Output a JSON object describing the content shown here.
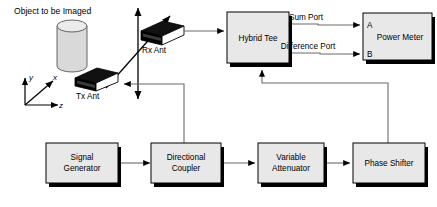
{
  "diagram": {
    "title_label": "Object to be Imaged",
    "colors": {
      "box_fill": "#e8e8e8",
      "box_stroke": "#000000",
      "shadow": "#000000",
      "line": "#6b6b6b",
      "antenna_body": "#000000",
      "cylinder_fill": "#d9d9d9"
    },
    "axes": [
      {
        "name": "y-axis-label",
        "label": "y"
      },
      {
        "name": "x-axis-label",
        "label": "x"
      },
      {
        "name": "z-axis-label",
        "label": "z"
      }
    ],
    "antennas": [
      {
        "name": "rx-antenna",
        "label": "Rx Ant"
      },
      {
        "name": "tx-antenna",
        "label": "Tx Ant"
      }
    ],
    "blocks": [
      {
        "id": "hybrid-tee",
        "label": "Hybrid Tee",
        "lines": [
          "Hybrid Tee"
        ]
      },
      {
        "id": "power-meter",
        "label": "Power Meter",
        "lines": [
          "Power Meter"
        ]
      },
      {
        "id": "signal-generator",
        "label": "Signal Generator",
        "lines": [
          "Signal",
          "Generator"
        ]
      },
      {
        "id": "directional-coupler",
        "label": "Directional Coupler",
        "lines": [
          "Directional",
          "Coupler"
        ]
      },
      {
        "id": "variable-attenuator",
        "label": "Variable Attenuator",
        "lines": [
          "Variable",
          "Attenuator"
        ]
      },
      {
        "id": "phase-shifter",
        "label": "Phase Shifter",
        "lines": [
          "Phase Shifter"
        ]
      }
    ],
    "connection_labels": [
      {
        "id": "sum-port",
        "label": "Sum Port"
      },
      {
        "id": "difference-port",
        "label": "Difference Port"
      }
    ],
    "power_meter_ports": [
      {
        "id": "port-a",
        "label": "A"
      },
      {
        "id": "port-b",
        "label": "B"
      }
    ]
  }
}
